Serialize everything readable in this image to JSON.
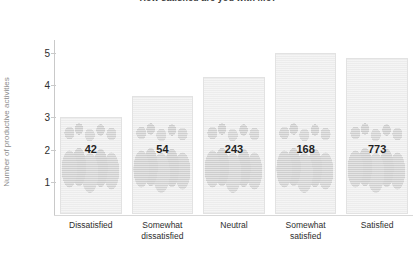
{
  "chart_data": {
    "type": "bar",
    "title": "How satisfied are you with life?",
    "xlabel": "",
    "ylabel": "Number of productive activities",
    "ylim": [
      0,
      5.4
    ],
    "yticks": [
      1,
      2,
      3,
      4,
      5
    ],
    "grid": false,
    "legend": "none",
    "categories": [
      "Dissatisfied",
      "Somewhat dissatisfied",
      "Neutral",
      "Somewhat satisfied",
      "Satisfied"
    ],
    "category_lines": [
      [
        "Dissatisfied"
      ],
      [
        "Somewhat",
        "dissatisfied"
      ],
      [
        "Neutral"
      ],
      [
        "Somewhat",
        "satisfied"
      ],
      [
        "Satisfied"
      ]
    ],
    "values": [
      3.0,
      3.65,
      4.25,
      5.0,
      4.85
    ],
    "point_labels": [
      "42",
      "54",
      "243",
      "168",
      "773"
    ],
    "bar_color": "#ececec",
    "bar_border_color": "#e2e2e2",
    "label_color": "#1f1f1f",
    "axis_color": "#c9c9c9",
    "ylabel_color": "#8c8c8c",
    "title_color": "#3a3a3a"
  }
}
